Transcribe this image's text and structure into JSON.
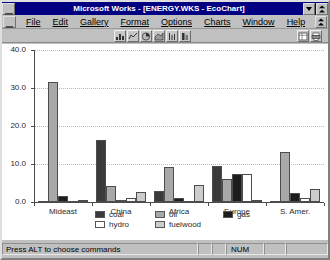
{
  "window": {
    "title": "Microsoft Works - [ENERGY.WKS - EcoChart]",
    "sys_menu_icon": "system-menu-icon",
    "minimize_icon": "minimize-icon",
    "restore_icon": "restore-icon"
  },
  "menubar": {
    "doc_sys_icon": "document-system-menu-icon",
    "items": [
      {
        "label": "File",
        "accel": "F"
      },
      {
        "label": "Edit",
        "accel": "E"
      },
      {
        "label": "Gallery",
        "accel": "G"
      },
      {
        "label": "Format",
        "accel": "t"
      },
      {
        "label": "Options",
        "accel": "O"
      },
      {
        "label": "Charts",
        "accel": "C"
      },
      {
        "label": "Window",
        "accel": "W"
      },
      {
        "label": "Help",
        "accel": "H"
      }
    ],
    "doc_restore_icon": "document-restore-icon"
  },
  "toolbar": {
    "buttons": [
      {
        "name": "bar-chart-tool",
        "icon": "bar-chart-icon"
      },
      {
        "name": "line-chart-tool",
        "icon": "line-chart-icon"
      },
      {
        "name": "pie-chart-tool",
        "icon": "pie-chart-icon"
      },
      {
        "name": "area-chart-tool",
        "icon": "area-chart-icon"
      },
      {
        "name": "hilo-chart-tool",
        "icon": "hilo-chart-icon"
      },
      {
        "name": "stacked-bar-chart-tool",
        "icon": "stacked-bar-chart-icon"
      }
    ],
    "right_buttons": [
      {
        "name": "spreadsheet-view-tool",
        "icon": "spreadsheet-icon"
      },
      {
        "name": "print-tool",
        "icon": "printer-icon"
      }
    ]
  },
  "statusbar": {
    "message": "Press ALT to choose commands",
    "num_indicator": "NUM"
  },
  "chart_data": {
    "type": "bar",
    "title": "",
    "xlabel": "",
    "ylabel": "",
    "ylim": [
      0,
      40
    ],
    "yticks": [
      "0.0",
      "10.0",
      "20.0",
      "30.0",
      "40.0"
    ],
    "ytick_values": [
      0,
      10,
      20,
      30,
      40
    ],
    "grid": true,
    "legend_position": "bottom",
    "categories": [
      "Mideast",
      "China",
      "Africa",
      "Europe",
      "S. Amer."
    ],
    "series": [
      {
        "name": "coal",
        "color": "#3a3a3a",
        "values": [
          0.1,
          16.2,
          3.0,
          9.6,
          0.3
        ]
      },
      {
        "name": "oil",
        "color": "#a8a8a8",
        "values": [
          31.6,
          4.1,
          9.1,
          6.0,
          13.1
        ]
      },
      {
        "name": "gas",
        "color": "#1c1c1c",
        "values": [
          1.6,
          0.5,
          1.0,
          7.5,
          2.4
        ]
      },
      {
        "name": "hydro",
        "color": "#ffffff",
        "values": [
          0.05,
          1.1,
          0.2,
          7.4,
          1.1
        ]
      },
      {
        "name": "fuelwood",
        "color": "#cccccc",
        "values": [
          0.4,
          2.6,
          4.6,
          0.5,
          3.5
        ]
      }
    ]
  }
}
